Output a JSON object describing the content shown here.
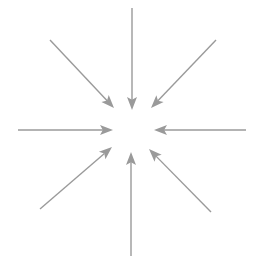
{
  "diagram": {
    "type": "radial-convergence",
    "background_color": "#ffffff",
    "arrow_color": "#9a9a9a",
    "arrow_count": 8,
    "center": {
      "x": 132,
      "y": 131
    },
    "inner_gap_radius": 22,
    "shaft_width": 1.4,
    "head_length": 13,
    "head_half_width": 5,
    "arrows": [
      {
        "name": "arrow-from-left",
        "direction_label": "left-to-center",
        "angle_deg": 0,
        "tail": {
          "x": 18,
          "y": 130
        },
        "tip": {
          "x": 113,
          "y": 130
        }
      },
      {
        "name": "arrow-from-top-left",
        "direction_label": "top-left-to-center",
        "angle_deg": 45,
        "tail": {
          "x": 50,
          "y": 40
        },
        "tip": {
          "x": 114,
          "y": 108
        }
      },
      {
        "name": "arrow-from-top",
        "direction_label": "top-to-center",
        "angle_deg": 90,
        "tail": {
          "x": 132,
          "y": 8
        },
        "tip": {
          "x": 132,
          "y": 110
        }
      },
      {
        "name": "arrow-from-top-right",
        "direction_label": "top-right-to-center",
        "angle_deg": 135,
        "tail": {
          "x": 216,
          "y": 40
        },
        "tip": {
          "x": 151,
          "y": 108
        }
      },
      {
        "name": "arrow-from-right",
        "direction_label": "right-to-center",
        "angle_deg": 180,
        "tail": {
          "x": 246,
          "y": 130
        },
        "tip": {
          "x": 154,
          "y": 130
        }
      },
      {
        "name": "arrow-from-bottom-right",
        "direction_label": "bottom-right-to-center",
        "angle_deg": 225,
        "tail": {
          "x": 211,
          "y": 212
        },
        "tip": {
          "x": 149,
          "y": 149
        }
      },
      {
        "name": "arrow-from-bottom",
        "direction_label": "bottom-to-center",
        "angle_deg": 270,
        "tail": {
          "x": 131,
          "y": 256
        },
        "tip": {
          "x": 131,
          "y": 152
        }
      },
      {
        "name": "arrow-from-bottom-left",
        "direction_label": "bottom-left-to-center",
        "angle_deg": 315,
        "tail": {
          "x": 40,
          "y": 209
        },
        "tip": {
          "x": 112,
          "y": 147
        }
      }
    ]
  }
}
